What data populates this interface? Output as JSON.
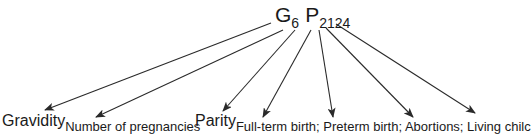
{
  "formula": {
    "gravidity_symbol": "G",
    "gravidity_value": "6",
    "parity_symbol": "P",
    "parity_value": "2124"
  },
  "labels": {
    "gravidity": {
      "main": "Gravidity",
      "sub": "Number of pregnancies"
    },
    "parity": {
      "main": "Parity",
      "sub": "Full-term birth; Preterm birth; Abortions; Living chilc"
    }
  },
  "arrows": [
    {
      "from": "G",
      "to": "Gravidity"
    },
    {
      "from": "6",
      "to": "Number of pregnancies"
    },
    {
      "from": "P",
      "to": "Parity"
    },
    {
      "from": "2",
      "to": "Full-term birth"
    },
    {
      "from": "1",
      "to": "Preterm birth"
    },
    {
      "from": "2",
      "to": "Abortions"
    },
    {
      "from": "4",
      "to": "Living child"
    }
  ],
  "colors": {
    "line": "#2a2a2a",
    "text": "#1a1a1a",
    "background": "#ffffff"
  }
}
